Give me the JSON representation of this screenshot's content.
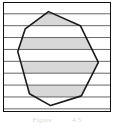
{
  "figure": {
    "caption_label": "Figure",
    "caption_number": "4.5",
    "frame": {
      "border_color": "#111111",
      "background_color": "#ffffff",
      "x": 3,
      "y": 2,
      "width": 108,
      "height": 110
    }
  },
  "chart_data": {
    "type": "area",
    "title": "",
    "subtitle": "",
    "xlabel": "",
    "ylabel": "",
    "grid": true,
    "legend": null,
    "legend_position": "none",
    "xlim": [
      0,
      100
    ],
    "ylim": [
      0,
      100
    ],
    "axis_ticks_visible": false,
    "polygon": {
      "name": "convex-polygon",
      "fill_color": "#ffffff",
      "stroke_color": "#1a1a1a",
      "stroke_width": 1.6,
      "vertices": [
        [
          42,
          8
        ],
        [
          72,
          21
        ],
        [
          89,
          55
        ],
        [
          73,
          86
        ],
        [
          44,
          95
        ],
        [
          24,
          84
        ],
        [
          13,
          45
        ],
        [
          20,
          24
        ]
      ]
    },
    "gridlines": {
      "orientation": "horizontal",
      "color": "#555555",
      "stroke_width": 0.9,
      "count": 9,
      "y_values": [
        10,
        21,
        32,
        43,
        54,
        65,
        76,
        87,
        98
      ]
    },
    "shaded_bands": {
      "fill_color": "#d8d8d8",
      "clipped_to_polygon": true,
      "count": 4,
      "bands": [
        {
          "y_top": 10,
          "y_bottom": 21
        },
        {
          "y_top": 32,
          "y_bottom": 43
        },
        {
          "y_top": 54,
          "y_bottom": 65
        },
        {
          "y_top": 76,
          "y_bottom": 87
        }
      ]
    }
  }
}
